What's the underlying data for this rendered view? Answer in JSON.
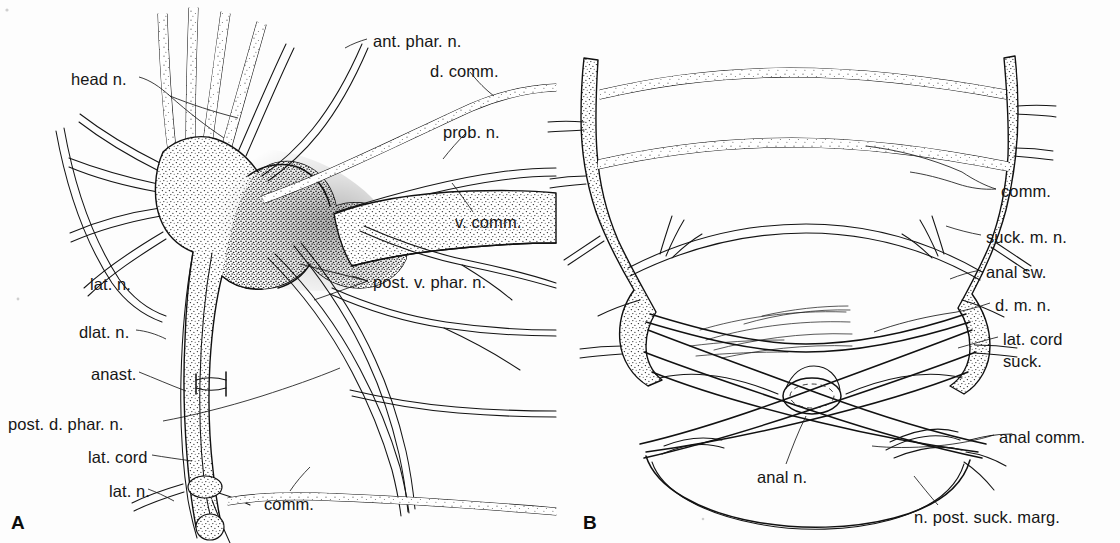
{
  "figure": {
    "background_color": "#fdfdfd",
    "ink_color": "#111111",
    "panels": [
      {
        "id": "A",
        "letter": "A",
        "description": "Anterior nervous system: brain ganglion with head nerves, pharyngeal nerves and lateral cords",
        "labels": [
          {
            "key": "ant_phar_n",
            "text": "ant. phar. n.",
            "x": 373,
            "y": 33,
            "align": "left"
          },
          {
            "key": "head_n",
            "text": "head n.",
            "x": 71,
            "y": 71,
            "align": "left"
          },
          {
            "key": "d_comm",
            "text": "d. comm.",
            "x": 430,
            "y": 63,
            "align": "left"
          },
          {
            "key": "prob_n",
            "text": "prob. n.",
            "x": 443,
            "y": 124,
            "align": "left"
          },
          {
            "key": "v_comm",
            "text": "v. comm.",
            "x": 455,
            "y": 214,
            "align": "left"
          },
          {
            "key": "post_v_phar_n",
            "text": "post. v. phar. n.",
            "x": 373,
            "y": 274,
            "align": "left"
          },
          {
            "key": "lat_n_upper",
            "text": "lat. n.",
            "x": 90,
            "y": 276,
            "align": "left"
          },
          {
            "key": "dlat_n",
            "text": "dlat. n.",
            "x": 79,
            "y": 324,
            "align": "left"
          },
          {
            "key": "anast",
            "text": "anast.",
            "x": 91,
            "y": 366,
            "align": "left"
          },
          {
            "key": "post_d_phar_n",
            "text": "post. d. phar. n.",
            "x": 8,
            "y": 416,
            "align": "left"
          },
          {
            "key": "lat_cord",
            "text": "lat. cord",
            "x": 88,
            "y": 449,
            "align": "left"
          },
          {
            "key": "lat_n_lower",
            "text": "lat. n.",
            "x": 109,
            "y": 483,
            "align": "left"
          },
          {
            "key": "comm",
            "text": "comm.",
            "x": 264,
            "y": 496,
            "align": "left"
          }
        ]
      },
      {
        "id": "B",
        "letter": "B",
        "description": "Posterior nervous system: commissures, anal swelling and posterior sucker nerve ring",
        "labels": [
          {
            "key": "comm",
            "text": "comm.",
            "x": 1001,
            "y": 183,
            "align": "left"
          },
          {
            "key": "suck_m_n",
            "text": "suck. m. n.",
            "x": 986,
            "y": 229,
            "align": "left"
          },
          {
            "key": "anal_sw",
            "text": "anal sw.",
            "x": 986,
            "y": 264,
            "align": "left"
          },
          {
            "key": "d_m_n",
            "text": "d. m. n.",
            "x": 995,
            "y": 297,
            "align": "left"
          },
          {
            "key": "lat_cord",
            "text": "lat. cord",
            "x": 1003,
            "y": 331,
            "align": "left"
          },
          {
            "key": "suck",
            "text": "suck.",
            "x": 1003,
            "y": 353,
            "align": "left"
          },
          {
            "key": "anal_comm",
            "text": "anal comm.",
            "x": 999,
            "y": 429,
            "align": "left"
          },
          {
            "key": "anal_n",
            "text": "anal n.",
            "x": 757,
            "y": 469,
            "align": "left"
          },
          {
            "key": "n_post_suck_marg",
            "text": "n. post. suck. marg.",
            "x": 914,
            "y": 509,
            "align": "left"
          }
        ]
      }
    ]
  }
}
